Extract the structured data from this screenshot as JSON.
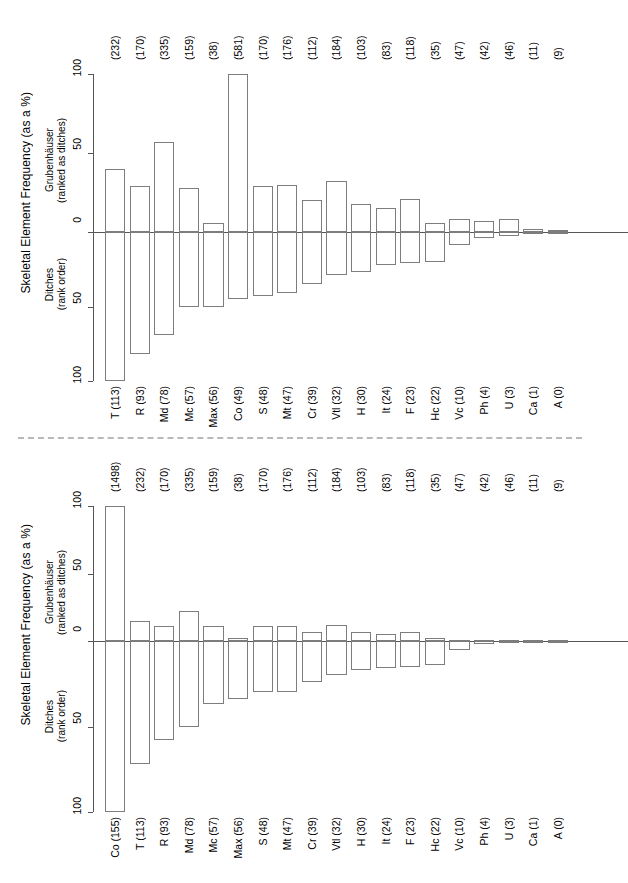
{
  "figure": {
    "axis_title": "Skeletal Element Frequency (as a %)",
    "upper_group_label_line1": "Grubenhäuser",
    "upper_group_label_line2": "(ranked as ditches)",
    "lower_group_label_line1": "Ditches",
    "lower_group_label_line2": "(rank order)",
    "tick_labels": [
      "100",
      "50",
      "0",
      "50",
      "100"
    ],
    "bar_stroke": "#7d7d7d",
    "axis_color": "#555555",
    "divider_color": "#b9b9b9"
  },
  "chart_data": [
    {
      "id": "panel-top",
      "type": "bar",
      "title": "",
      "subtitle": "",
      "orientation": "vertical-diverging",
      "xlabel": "",
      "ylabel": "Skeletal Element Frequency (as a %)",
      "ylim": [
        -100,
        100
      ],
      "yticks": [
        100,
        50,
        0,
        -50,
        -100
      ],
      "ytick_labels": [
        "100",
        "50",
        "0",
        "50",
        "100"
      ],
      "grid": false,
      "legend": "none",
      "up_series_name": "Grubenhäuser (ranked as ditches)",
      "down_series_name": "Ditches (rank order)",
      "categories": [
        "T",
        "R",
        "Md",
        "Mc",
        "Max",
        "Co",
        "S",
        "Mt",
        "Cr",
        "Vtl",
        "H",
        "It",
        "F",
        "Hc",
        "Vc",
        "Ph",
        "U",
        "Ca",
        "A"
      ],
      "bottom_labels": [
        "T (113)",
        "R (93)",
        "Md (78)",
        "Mc (57)",
        "Max (56)",
        "Co (49)",
        "S (48)",
        "Mt (47)",
        "Cr (39)",
        "Vtl (32)",
        "H (30)",
        "It (24)",
        "F (23)",
        "Hc (22)",
        "Vc (10)",
        "Ph (4)",
        "U (3)",
        "Ca (1)",
        "A (0)"
      ],
      "top_labels": [
        "(232)",
        "(170)",
        "(335)",
        "(159)",
        "(38)",
        "(581)",
        "(170)",
        "(176)",
        "(112)",
        "(184)",
        "(103)",
        "(83)",
        "(118)",
        "(35)",
        "(47)",
        "(42)",
        "(46)",
        "(11)",
        "(9)"
      ],
      "ditch_counts": [
        113,
        93,
        78,
        57,
        56,
        49,
        48,
        47,
        39,
        32,
        30,
        24,
        23,
        22,
        10,
        4,
        3,
        1,
        0
      ],
      "grubenhauser_counts": [
        232,
        170,
        335,
        159,
        38,
        581,
        170,
        176,
        112,
        184,
        103,
        83,
        118,
        35,
        47,
        42,
        46,
        11,
        9
      ],
      "series": [
        {
          "name": "Grubenhäuser (ranked as ditches)",
          "direction": "up",
          "values": [
            40,
            29,
            57,
            28,
            6,
            100,
            29,
            30,
            20,
            32,
            18,
            15,
            21,
            6,
            8,
            7,
            8,
            2,
            1
          ]
        },
        {
          "name": "Ditches (rank order)",
          "direction": "down",
          "values": [
            100,
            82,
            69,
            50,
            50,
            45,
            43,
            41,
            35,
            29,
            27,
            22,
            21,
            20,
            9,
            4,
            3,
            1,
            0
          ]
        }
      ]
    },
    {
      "id": "panel-bottom",
      "type": "bar",
      "title": "",
      "subtitle": "",
      "orientation": "vertical-diverging",
      "xlabel": "",
      "ylabel": "Skeletal Element Frequency (as a %)",
      "ylim": [
        -100,
        100
      ],
      "yticks": [
        100,
        50,
        0,
        -50,
        -100
      ],
      "ytick_labels": [
        "100",
        "50",
        "0",
        "50",
        "100"
      ],
      "grid": false,
      "legend": "none",
      "up_series_name": "Grubenhäuser (ranked as ditches)",
      "down_series_name": "Ditches (rank order)",
      "categories": [
        "Co",
        "T",
        "R",
        "Md",
        "Mc",
        "Max",
        "S",
        "Mt",
        "Cr",
        "Vtl",
        "H",
        "It",
        "F",
        "Hc",
        "Vc",
        "Ph",
        "U",
        "Ca",
        "A"
      ],
      "bottom_labels": [
        "Co (155)",
        "T (113)",
        "R (93)",
        "Md (78)",
        "Mc (57)",
        "Max (56)",
        "S (48)",
        "Mt (47)",
        "Cr (39)",
        "Vtl (32)",
        "H (30)",
        "It (24)",
        "F (23)",
        "Hc (22)",
        "Vc (10)",
        "Ph (4)",
        "U (3)",
        "Ca (1)",
        "A (0)"
      ],
      "top_labels": [
        "(1498)",
        "(232)",
        "(170)",
        "(335)",
        "(159)",
        "(38)",
        "(170)",
        "(176)",
        "(112)",
        "(184)",
        "(103)",
        "(83)",
        "(118)",
        "(35)",
        "(47)",
        "(42)",
        "(46)",
        "(11)",
        "(9)"
      ],
      "ditch_counts": [
        155,
        113,
        93,
        78,
        57,
        56,
        48,
        47,
        39,
        32,
        30,
        24,
        23,
        22,
        10,
        4,
        3,
        1,
        0
      ],
      "grubenhauser_counts": [
        1498,
        232,
        170,
        335,
        159,
        38,
        170,
        176,
        112,
        184,
        103,
        83,
        118,
        35,
        47,
        42,
        46,
        11,
        9
      ],
      "series": [
        {
          "name": "Grubenhäuser (ranked as ditches)",
          "direction": "up",
          "values": [
            100,
            15,
            11,
            22,
            11,
            2,
            11,
            11,
            7,
            12,
            7,
            5,
            7,
            2,
            1,
            0.5,
            0.5,
            0.3,
            0.2
          ]
        },
        {
          "name": "Ditches (rank order)",
          "direction": "down",
          "values": [
            100,
            72,
            58,
            50,
            37,
            34,
            30,
            30,
            24,
            20,
            17,
            16,
            15,
            14,
            5,
            2,
            1,
            0.5,
            0
          ]
        }
      ]
    }
  ]
}
